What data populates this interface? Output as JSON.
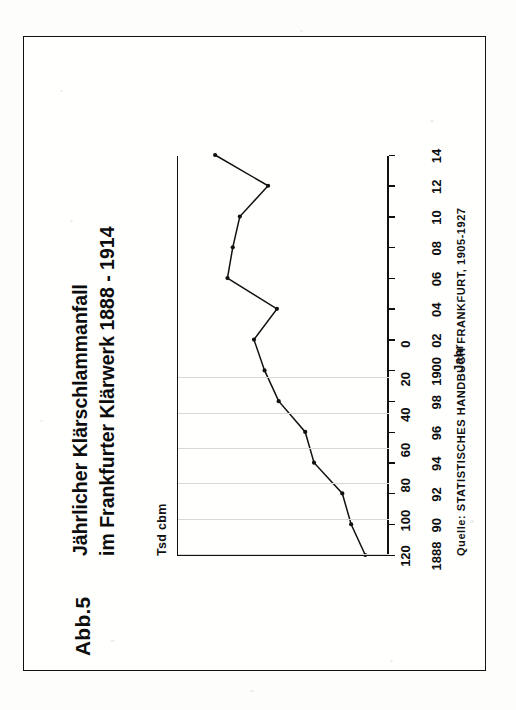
{
  "figure": {
    "number_label": "Abb.5",
    "title_line1": "Jährlicher Klärschlammanfall",
    "title_line2": "im Frankfurter Klärwerk 1888 - 1914",
    "source": "Quelle: STATISTISCHES HANDBUCH FRANKFURT, 1905-1927",
    "unit_label": "Tsd cbm",
    "orientation": "rotated-90-ccw",
    "colors": {
      "ink": "#111111",
      "paper": "#fdfdfc",
      "grid": "#d8d8d8"
    }
  },
  "chart_data": {
    "type": "line",
    "title": "Jährlicher Klärschlammanfall im Frankfurter Klärwerk 1888 - 1914",
    "xlabel": "Jahr",
    "ylabel": "Tsd cbm",
    "xlim": [
      1888,
      1914
    ],
    "ylim": [
      0,
      120
    ],
    "yticks": [
      0,
      20,
      40,
      60,
      80,
      100,
      120
    ],
    "ytick_labels": [
      "0",
      "20",
      "40",
      "60",
      "80",
      "100",
      "120"
    ],
    "xticks": [
      1888,
      1890,
      1892,
      1894,
      1896,
      1898,
      1900,
      1902,
      1904,
      1906,
      1908,
      1910,
      1912,
      1914
    ],
    "xtick_labels": [
      "1888",
      "90",
      "92",
      "94",
      "96",
      "98",
      "1900",
      "02",
      "04",
      "06",
      "08",
      "10",
      "12",
      "14"
    ],
    "grid": "vertical-only",
    "legend": "none",
    "markers": true,
    "x": [
      1888,
      1890,
      1892,
      1894,
      1896,
      1898,
      1900,
      1902,
      1904,
      1906,
      1908,
      1910,
      1912,
      1914
    ],
    "values": [
      14,
      22,
      27,
      43,
      48,
      63,
      71,
      77,
      64,
      92,
      89,
      85,
      69,
      99
    ],
    "series": [
      {
        "name": "Klärschlammanfall",
        "values": [
          14,
          22,
          27,
          43,
          48,
          63,
          71,
          77,
          64,
          92,
          89,
          85,
          69,
          99
        ]
      }
    ]
  }
}
